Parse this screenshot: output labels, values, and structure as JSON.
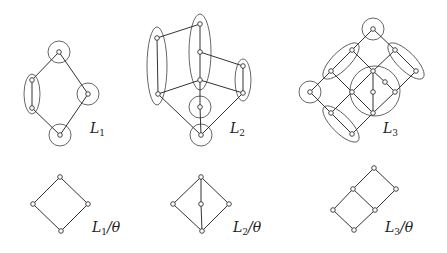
{
  "figure": {
    "colors": {
      "line": "#333333",
      "node_fill": "#ffffff",
      "background": "#ffffff"
    }
  },
  "lattices": [
    {
      "id": "L1",
      "label": "L",
      "subscript": "1",
      "label_pos": [
        90,
        133
      ],
      "nodes": [
        [
          59,
          52
        ],
        [
          32,
          80
        ],
        [
          32,
          108
        ],
        [
          88,
          94
        ],
        [
          60,
          135
        ]
      ],
      "edges": [
        [
          0,
          1
        ],
        [
          1,
          2
        ],
        [
          2,
          4
        ],
        [
          0,
          3
        ],
        [
          3,
          4
        ]
      ],
      "groups": [
        {
          "type": "circle",
          "cx": 59,
          "cy": 52,
          "r": 11
        },
        {
          "type": "ellipse",
          "cx": 32,
          "cy": 94,
          "rx": 8,
          "ry": 20,
          "rot": 0
        },
        {
          "type": "circle",
          "cx": 88,
          "cy": 94,
          "r": 11
        },
        {
          "type": "circle",
          "cx": 60,
          "cy": 135,
          "r": 11
        }
      ]
    },
    {
      "id": "L2",
      "label": "L",
      "subscript": "2",
      "label_pos": [
        230,
        133
      ],
      "nodes": [
        [
          200,
          24
        ],
        [
          157,
          38
        ],
        [
          200,
          52
        ],
        [
          243,
          66
        ],
        [
          200,
          80
        ],
        [
          158,
          94
        ],
        [
          243,
          93
        ],
        [
          200,
          107
        ],
        [
          201,
          135
        ]
      ],
      "edges": [
        [
          1,
          0
        ],
        [
          1,
          5
        ],
        [
          0,
          2
        ],
        [
          2,
          4
        ],
        [
          2,
          3
        ],
        [
          3,
          6
        ],
        [
          5,
          4
        ],
        [
          4,
          6
        ],
        [
          5,
          8
        ],
        [
          6,
          8
        ],
        [
          4,
          7
        ],
        [
          7,
          8
        ]
      ],
      "groups": [
        {
          "type": "ellipse",
          "cx": 157,
          "cy": 66,
          "rx": 10,
          "ry": 39,
          "rot": 0
        },
        {
          "type": "ellipse",
          "cx": 200,
          "cy": 52,
          "rx": 11,
          "ry": 38,
          "rot": 0
        },
        {
          "type": "ellipse",
          "cx": 243,
          "cy": 80,
          "rx": 8,
          "ry": 21,
          "rot": 0
        },
        {
          "type": "circle",
          "cx": 200,
          "cy": 107,
          "r": 11
        },
        {
          "type": "circle",
          "cx": 201,
          "cy": 135,
          "r": 11
        }
      ]
    },
    {
      "id": "L3",
      "label": "L",
      "subscript": "3",
      "label_pos": [
        383,
        133
      ],
      "nodes": [
        [
          373,
          29
        ],
        [
          352,
          50
        ],
        [
          395,
          50
        ],
        [
          331,
          71
        ],
        [
          373,
          71
        ],
        [
          416,
          71
        ],
        [
          385,
          82
        ],
        [
          310,
          92
        ],
        [
          352,
          92
        ],
        [
          373,
          92
        ],
        [
          395,
          92
        ],
        [
          331,
          113
        ],
        [
          373,
          113
        ],
        [
          352,
          134
        ]
      ],
      "edges": [
        [
          0,
          1
        ],
        [
          0,
          2
        ],
        [
          1,
          3
        ],
        [
          1,
          4
        ],
        [
          2,
          4
        ],
        [
          2,
          5
        ],
        [
          3,
          7
        ],
        [
          3,
          8
        ],
        [
          4,
          8
        ],
        [
          4,
          6
        ],
        [
          6,
          10
        ],
        [
          4,
          9
        ],
        [
          9,
          12
        ],
        [
          5,
          10
        ],
        [
          7,
          11
        ],
        [
          8,
          11
        ],
        [
          8,
          12
        ],
        [
          10,
          12
        ],
        [
          11,
          13
        ],
        [
          12,
          13
        ]
      ],
      "groups": [
        {
          "type": "circle",
          "cx": 373,
          "cy": 29,
          "r": 11
        },
        {
          "type": "circle",
          "cx": 310,
          "cy": 92,
          "r": 11
        },
        {
          "type": "circle",
          "cx": 375,
          "cy": 91,
          "r": 25
        },
        {
          "type": "ellipse",
          "cx": 341,
          "cy": 61,
          "rx": 24,
          "ry": 9,
          "rot": -45
        },
        {
          "type": "ellipse",
          "cx": 406,
          "cy": 61,
          "rx": 24,
          "ry": 9,
          "rot": 45
        },
        {
          "type": "ellipse",
          "cx": 341,
          "cy": 124,
          "rx": 24,
          "ry": 9,
          "rot": 45
        }
      ]
    }
  ],
  "quotients": [
    {
      "id": "L1/theta",
      "label": "L",
      "subscript": "1",
      "suffix": "/θ",
      "label_pos": [
        92,
        232
      ],
      "nodes": [
        [
          60,
          177
        ],
        [
          33,
          204
        ],
        [
          88,
          204
        ],
        [
          61,
          231
        ]
      ],
      "edges": [
        [
          0,
          1
        ],
        [
          0,
          2
        ],
        [
          1,
          3
        ],
        [
          2,
          3
        ]
      ]
    },
    {
      "id": "L2/theta",
      "label": "L",
      "subscript": "2",
      "suffix": "/θ",
      "label_pos": [
        233,
        232
      ],
      "nodes": [
        [
          201,
          177
        ],
        [
          173,
          204
        ],
        [
          201,
          204
        ],
        [
          229,
          204
        ],
        [
          202,
          231
        ]
      ],
      "edges": [
        [
          0,
          1
        ],
        [
          0,
          2
        ],
        [
          0,
          3
        ],
        [
          1,
          4
        ],
        [
          2,
          4
        ],
        [
          3,
          4
        ]
      ]
    },
    {
      "id": "L3/theta",
      "label": "L",
      "subscript": "3",
      "suffix": "/θ",
      "label_pos": [
        385,
        232
      ],
      "nodes": [
        [
          374,
          168
        ],
        [
          353,
          189
        ],
        [
          396,
          189
        ],
        [
          333,
          210
        ],
        [
          375,
          210
        ],
        [
          354,
          230
        ]
      ],
      "edges": [
        [
          0,
          1
        ],
        [
          0,
          2
        ],
        [
          1,
          3
        ],
        [
          1,
          4
        ],
        [
          2,
          4
        ],
        [
          3,
          5
        ],
        [
          4,
          5
        ]
      ]
    }
  ]
}
